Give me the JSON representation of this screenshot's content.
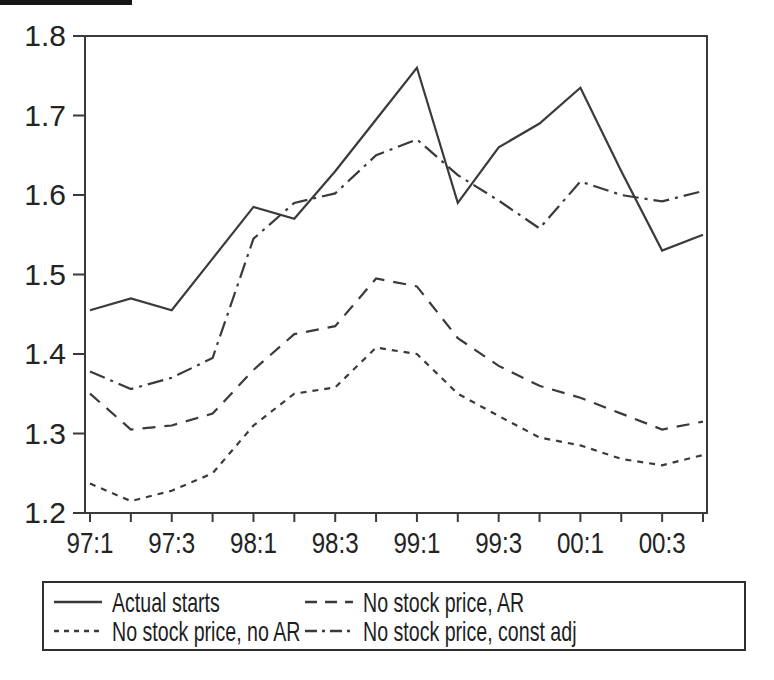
{
  "chart_data": {
    "type": "line",
    "title": "",
    "xlabel": "",
    "ylabel": "",
    "categories": [
      "97:1",
      "97:2",
      "97:3",
      "97:4",
      "98:1",
      "98:2",
      "98:3",
      "98:4",
      "99:1",
      "99:2",
      "99:3",
      "99:4",
      "00:1",
      "00:2",
      "00:3",
      "00:4"
    ],
    "x_tick_labels_shown": [
      "97:1",
      "97:3",
      "98:1",
      "98:3",
      "99:1",
      "99:3",
      "00:1",
      "00:3"
    ],
    "x_tick_label_every": 2,
    "y_ticks": [
      1.2,
      1.3,
      1.4,
      1.5,
      1.6,
      1.7,
      1.8
    ],
    "ylim": [
      1.2,
      1.8
    ],
    "grid": false,
    "legend_position": "bottom",
    "line_color": "#3a3a3a",
    "series": [
      {
        "name": "Actual starts",
        "line_style": "solid",
        "values": [
          1.455,
          1.47,
          1.455,
          1.52,
          1.585,
          1.57,
          1.63,
          1.695,
          1.76,
          1.59,
          1.66,
          1.69,
          1.735,
          1.63,
          1.53,
          1.55
        ]
      },
      {
        "name": "No stock price, AR",
        "line_style": "dashed",
        "values": [
          1.35,
          1.305,
          1.31,
          1.325,
          1.38,
          1.425,
          1.435,
          1.495,
          1.485,
          1.42,
          1.385,
          1.36,
          1.345,
          1.325,
          1.305,
          1.315
        ]
      },
      {
        "name": "No stock price, no AR",
        "line_style": "dotted",
        "values": [
          1.237,
          1.215,
          1.228,
          1.25,
          1.31,
          1.35,
          1.358,
          1.408,
          1.4,
          1.35,
          1.322,
          1.295,
          1.285,
          1.268,
          1.26,
          1.273
        ]
      },
      {
        "name": "No stock price, const adj",
        "line_style": "dashdot",
        "values": [
          1.378,
          1.356,
          1.37,
          1.395,
          1.545,
          1.59,
          1.602,
          1.65,
          1.67,
          1.625,
          1.593,
          1.558,
          1.617,
          1.6,
          1.592,
          1.605
        ]
      }
    ]
  }
}
